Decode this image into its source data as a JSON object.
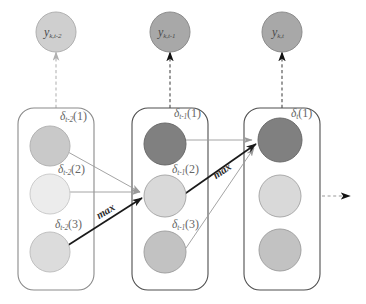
{
  "diagram": {
    "columns": [
      {
        "id": "col-t-minus-2",
        "output_node": {
          "name": "y-node-t-minus-2",
          "base": "y",
          "sub": "k,t-2",
          "fill": "#cfcfcf"
        },
        "states": [
          {
            "index": 1,
            "label_base": "δ",
            "label_sub": "t-2",
            "label_arg": "(1)",
            "fill": "#c9c9c9"
          },
          {
            "index": 2,
            "label_base": "δ",
            "label_sub": "t-2",
            "label_arg": "(2)",
            "fill": "#ececec"
          },
          {
            "index": 3,
            "label_base": "δ",
            "label_sub": "t-2",
            "label_arg": "(3)",
            "fill": "#dcdcdc"
          }
        ],
        "max_label": "max",
        "max_on_state": 3
      },
      {
        "id": "col-t-minus-1",
        "output_node": {
          "name": "y-node-t-minus-1",
          "base": "y",
          "sub": "k,t-1",
          "fill": "#a8a8a8"
        },
        "states": [
          {
            "index": 1,
            "label_base": "δ",
            "label_sub": "t-1",
            "label_arg": "(1)",
            "fill": "#808080"
          },
          {
            "index": 2,
            "label_base": "δ",
            "label_sub": "t-1",
            "label_arg": "(2)",
            "fill": "#d9d9d9"
          },
          {
            "index": 3,
            "label_base": "δ",
            "label_sub": "t-1",
            "label_arg": "(3)",
            "fill": "#c2c2c2"
          }
        ],
        "max_label": "max",
        "max_on_state": 2
      },
      {
        "id": "col-t",
        "output_node": {
          "name": "y-node-t",
          "base": "y",
          "sub": "k,t",
          "fill": "#a8a8a8"
        },
        "states": [
          {
            "index": 1,
            "label_base": "δ",
            "label_sub": "t",
            "label_arg": "(1)",
            "fill": "#808080"
          },
          {
            "index": 2,
            "label_base": "",
            "label_sub": "",
            "label_arg": "",
            "fill": "#d9d9d9"
          },
          {
            "index": 3,
            "label_base": "",
            "label_sub": "",
            "label_arg": "",
            "fill": "#c2c2c2"
          }
        ],
        "max_label": "",
        "max_on_state": 0
      }
    ],
    "colors": {
      "box_stroke": "#6f6f6f",
      "thin_arrow": "#9a9a9a",
      "bold_arrow": "#1a1a1a",
      "dashed_emit": "#b5b5b5",
      "dashed_emit_dark": "#1a1a1a",
      "circle_stroke": "#8c8c8c",
      "background": "#ffffff"
    },
    "continuation_arrow": {
      "name": "continuation-arrow",
      "style": "dashed-right"
    }
  }
}
